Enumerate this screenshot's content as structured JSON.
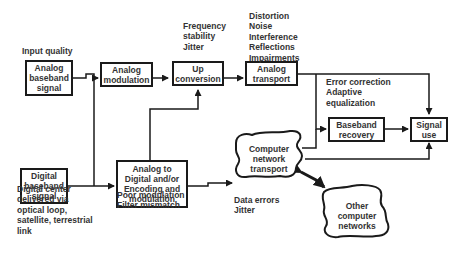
{
  "diagram": {
    "type": "signal-flow block diagram",
    "blocks": {
      "analog_baseband": "Analog\nbaseband\nsignal",
      "analog_modulation": "Analog\nmodulation",
      "up_conversion": "Up\nconversion",
      "analog_transport": "Analog\ntransport",
      "digital_baseband": "Digital\nbaseband\nsignal",
      "a2d_encoding": "Analog to\nDigital and/or\nEncoding and\nmodulation",
      "computer_network": "Computer\nnetwork\ntransport",
      "baseband_recovery": "Baseband\nrecovery",
      "signal_use": "Signal\nuse",
      "other_networks": "Other\ncomputer\nnetworks"
    },
    "annotations": {
      "input_quality": "Input quality",
      "frequency": "Frequency\nstability\nJitter",
      "distortion": "Distortion\nNoise\nInterference\nReflections\nImpairments",
      "error_correction": "Error correction\nAdaptive\nequalization",
      "digital_center": "Digital center\ndelivered via\noptical loop,\nsatellite, terrestrial\nlink",
      "poor_modulation": "Poor modulation\nFilter mismatch",
      "data_errors": "Data errors\nJitter"
    },
    "connections": [
      {
        "from": "Analog baseband signal",
        "to": "Analog modulation"
      },
      {
        "from": "Analog baseband signal",
        "to": "Analog to Digital and/or Encoding and modulation"
      },
      {
        "from": "Digital baseband signal",
        "to": "Analog to Digital and/or Encoding and modulation"
      },
      {
        "from": "Analog modulation",
        "to": "Up conversion"
      },
      {
        "from": "Analog to Digital and/or Encoding and modulation",
        "to": "Up conversion"
      },
      {
        "from": "Analog to Digital and/or Encoding and modulation",
        "to": "Computer network transport"
      },
      {
        "from": "Up conversion",
        "to": "Analog transport"
      },
      {
        "from": "Analog transport",
        "to": "Signal use"
      },
      {
        "from": "Analog transport",
        "to": "Baseband recovery"
      },
      {
        "from": "Computer network transport",
        "to": "Baseband recovery"
      },
      {
        "from": "Computer network transport",
        "to": "Signal use"
      },
      {
        "from": "Baseband recovery",
        "to": "Signal use"
      },
      {
        "from": "Computer network transport",
        "to": "Other computer networks",
        "bidirectional": true
      }
    ]
  }
}
